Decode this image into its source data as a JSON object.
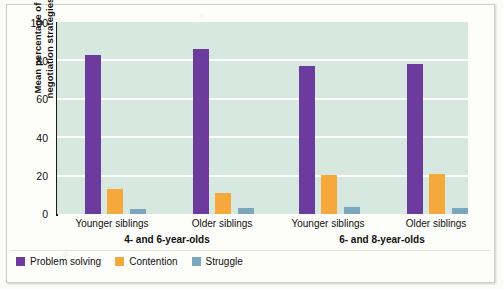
{
  "chart_data": {
    "type": "bar",
    "title": "",
    "xlabel": "",
    "ylabel": "Mean percentage of negotiation strategies",
    "ylim": [
      0,
      100
    ],
    "yticks": [
      0,
      20,
      40,
      60,
      80,
      100
    ],
    "grid": true,
    "legend_position": "bottom-left",
    "categories": [
      "Younger siblings",
      "Older siblings",
      "Younger siblings",
      "Older siblings"
    ],
    "group_labels": [
      "4- and 6-year-olds",
      "6- and 8-year-olds"
    ],
    "series": [
      {
        "name": "Problem solving",
        "color": "#6B3C9E",
        "values": [
          83,
          86,
          77,
          78
        ]
      },
      {
        "name": "Contention",
        "color": "#F5A83C",
        "values": [
          13,
          11,
          20.5,
          21
        ]
      },
      {
        "name": "Struggle",
        "color": "#7BA7BC",
        "values": [
          2.5,
          3,
          3.5,
          3
        ]
      }
    ]
  },
  "axis": {
    "y_title_line1": "Mean percentage of",
    "y_title_line2": "negotiation strategies",
    "tick_labels": [
      "100",
      "80",
      "60",
      "40",
      "20",
      "0"
    ]
  },
  "xaxis": {
    "cat_labels": [
      "Younger siblings",
      "Older siblings",
      "Younger siblings",
      "Older siblings"
    ],
    "group_labels": [
      "4- and 6-year-olds",
      "6- and 8-year-olds"
    ]
  },
  "legend": {
    "items": [
      {
        "label": "Problem solving",
        "color": "#6B3C9E"
      },
      {
        "label": "Contention",
        "color": "#F5A83C"
      },
      {
        "label": "Struggle",
        "color": "#7BA7BC"
      }
    ]
  },
  "colors": {
    "plot_background": "#D7E8E1",
    "gridline": "#FFFFFF",
    "axis": "#1A1A1A",
    "paper": "#FDFDFA"
  }
}
